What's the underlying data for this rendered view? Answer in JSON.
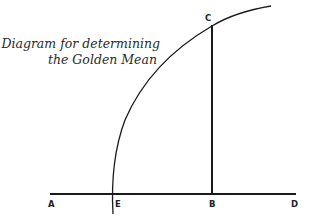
{
  "caption": {
    "line1": "Diagram for determining",
    "line2": "the Golden Mean"
  },
  "diagram": {
    "type": "geometric-construction",
    "points": {
      "A": {
        "label": "A",
        "x": 50,
        "y": 194
      },
      "E": {
        "label": "E",
        "x": 112,
        "y": 194
      },
      "B": {
        "label": "B",
        "x": 212,
        "y": 194
      },
      "D": {
        "label": "D",
        "x": 296,
        "y": 194
      },
      "C": {
        "label": "C",
        "x": 212,
        "y": 26
      }
    },
    "segments": [
      {
        "name": "AD",
        "from": "A",
        "to": "D"
      },
      {
        "name": "BC",
        "from": "B",
        "to": "C"
      }
    ],
    "arc": {
      "through": [
        "C",
        "E"
      ],
      "center_hint": "D"
    },
    "line_color": "#1a1a1a"
  }
}
